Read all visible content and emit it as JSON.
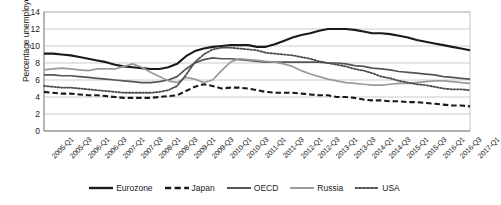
{
  "chart_data": {
    "type": "line",
    "title": "",
    "xlabel": "",
    "ylabel": "Percentage unemployed",
    "ylim": [
      0,
      14
    ],
    "ytick_step": 2,
    "yticks": [
      "0",
      "2",
      "4",
      "6",
      "8",
      "10",
      "12",
      "14"
    ],
    "grid": true,
    "legend_position": "bottom",
    "x": [
      "2005-Q1",
      "2005-Q2",
      "2005-Q3",
      "2005-Q4",
      "2006-Q1",
      "2006-Q2",
      "2006-Q3",
      "2006-Q4",
      "2007-Q1",
      "2007-Q2",
      "2007-Q3",
      "2007-Q4",
      "2008-Q1",
      "2008-Q2",
      "2008-Q3",
      "2008-Q4",
      "2009-Q1",
      "2009-Q2",
      "2009-Q3",
      "2009-Q4",
      "2010-Q1",
      "2010-Q2",
      "2010-Q3",
      "2010-Q4",
      "2011-Q1",
      "2011-Q2",
      "2011-Q3",
      "2011-Q4",
      "2012-Q1",
      "2012-Q2",
      "2012-Q3",
      "2012-Q4",
      "2013-Q1",
      "2013-Q2",
      "2013-Q3",
      "2013-Q4",
      "2014-Q1",
      "2014-Q2",
      "2014-Q3",
      "2014-Q4",
      "2015-Q1",
      "2015-Q2",
      "2015-Q3",
      "2015-Q4",
      "2016-Q1",
      "2016-Q2",
      "2016-Q3",
      "2016-Q4",
      "2017-Q1"
    ],
    "xticks": [
      "2005-Q1",
      "2005-Q3",
      "2006-Q1",
      "2006-Q3",
      "2007-Q1",
      "2007-Q3",
      "2008-Q1",
      "2008-Q3",
      "2009-Q1",
      "2009-Q3",
      "2010-Q1",
      "2010-Q3",
      "2011-Q1",
      "2011-Q3",
      "2012-Q1",
      "2012-Q3",
      "2013-Q1",
      "2013-Q3",
      "2014-Q1",
      "2014-Q3",
      "2015-Q1",
      "2015-Q3",
      "2016-Q1",
      "2016-Q3",
      "2017-Q1"
    ],
    "series": [
      {
        "name": "Eurozone",
        "color": "#1a1a1a",
        "style": "solid",
        "width": 2.1,
        "values": [
          9.1,
          9.1,
          9.0,
          8.9,
          8.7,
          8.5,
          8.3,
          8.1,
          7.8,
          7.6,
          7.5,
          7.4,
          7.3,
          7.3,
          7.5,
          7.9,
          8.8,
          9.4,
          9.7,
          9.9,
          10.0,
          10.1,
          10.1,
          10.1,
          9.9,
          9.9,
          10.2,
          10.6,
          11.0,
          11.3,
          11.5,
          11.8,
          12.0,
          12.0,
          12.0,
          11.9,
          11.7,
          11.5,
          11.5,
          11.4,
          11.2,
          11.0,
          10.7,
          10.5,
          10.3,
          10.1,
          9.9,
          9.7,
          9.5
        ]
      },
      {
        "name": "Japan",
        "color": "#1a1a1a",
        "style": "dashed",
        "width": 2.1,
        "values": [
          4.6,
          4.5,
          4.4,
          4.4,
          4.3,
          4.2,
          4.2,
          4.1,
          4.0,
          3.9,
          3.9,
          3.9,
          3.9,
          4.0,
          4.1,
          4.2,
          4.7,
          5.2,
          5.5,
          5.3,
          5.0,
          5.1,
          5.1,
          5.0,
          4.8,
          4.6,
          4.5,
          4.5,
          4.5,
          4.4,
          4.3,
          4.2,
          4.2,
          4.0,
          4.0,
          3.9,
          3.7,
          3.6,
          3.6,
          3.5,
          3.5,
          3.4,
          3.4,
          3.3,
          3.2,
          3.1,
          3.0,
          3.0,
          2.9
        ]
      },
      {
        "name": "OECD",
        "color": "#555555",
        "style": "solid",
        "width": 1.7,
        "values": [
          6.6,
          6.6,
          6.5,
          6.5,
          6.4,
          6.3,
          6.2,
          6.1,
          6.0,
          5.9,
          5.8,
          5.7,
          5.7,
          5.8,
          6.0,
          6.4,
          7.3,
          8.0,
          8.4,
          8.6,
          8.5,
          8.5,
          8.4,
          8.3,
          8.2,
          8.1,
          8.1,
          8.1,
          8.1,
          8.1,
          8.1,
          8.1,
          8.0,
          8.0,
          7.9,
          7.7,
          7.6,
          7.4,
          7.3,
          7.2,
          7.0,
          6.9,
          6.8,
          6.7,
          6.6,
          6.4,
          6.3,
          6.2,
          6.1
        ]
      },
      {
        "name": "Russia",
        "color": "#9a9a9a",
        "style": "solid",
        "width": 1.7,
        "values": [
          7.2,
          7.3,
          7.4,
          7.3,
          7.2,
          7.1,
          7.3,
          7.3,
          7.3,
          7.6,
          7.9,
          7.5,
          6.9,
          6.4,
          5.9,
          5.7,
          6.3,
          6.1,
          5.7,
          6.0,
          7.1,
          8.1,
          8.5,
          8.4,
          8.3,
          8.2,
          8.1,
          7.9,
          7.6,
          7.1,
          6.7,
          6.4,
          6.1,
          5.9,
          5.7,
          5.6,
          5.5,
          5.4,
          5.4,
          5.5,
          5.6,
          5.6,
          5.7,
          5.8,
          5.9,
          5.9,
          5.8,
          5.7,
          5.6
        ]
      },
      {
        "name": "USA",
        "color": "#4d4d4d",
        "style": "dotted",
        "width": 1.8,
        "values": [
          5.3,
          5.2,
          5.1,
          5.1,
          5.0,
          4.9,
          4.8,
          4.7,
          4.6,
          4.5,
          4.5,
          4.5,
          4.5,
          4.6,
          4.8,
          5.3,
          6.6,
          8.1,
          9.0,
          9.6,
          9.8,
          9.8,
          9.7,
          9.6,
          9.5,
          9.2,
          9.1,
          9.0,
          8.9,
          8.7,
          8.5,
          8.2,
          8.0,
          7.8,
          7.6,
          7.3,
          7.1,
          6.8,
          6.4,
          6.2,
          5.9,
          5.7,
          5.5,
          5.4,
          5.2,
          5.0,
          4.9,
          4.9,
          4.8
        ]
      }
    ]
  }
}
